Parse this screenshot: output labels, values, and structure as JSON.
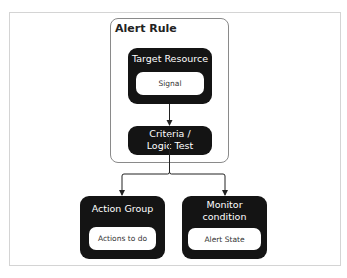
{
  "diagram": {
    "container": {
      "title": "Alert Rule"
    },
    "nodes": [
      {
        "id": "target",
        "title": "Target Resource",
        "inner": "Signal"
      },
      {
        "id": "criteria",
        "title_line1": "Criteria /",
        "title_line2": "Logic Test"
      },
      {
        "id": "action",
        "title": "Action Group",
        "inner": "Actions to do"
      },
      {
        "id": "monitor",
        "title_line1": "Monitor",
        "title_line2": "condition",
        "inner": "Alert State"
      }
    ],
    "edges": [
      {
        "from": "target",
        "to": "criteria"
      },
      {
        "from": "criteria",
        "to": "action"
      },
      {
        "from": "criteria",
        "to": "monitor"
      }
    ],
    "colors": {
      "node_fill": "#141414",
      "node_text": "#ffffff",
      "inner_fill": "#ffffff",
      "border": "#8a8a8a"
    }
  }
}
